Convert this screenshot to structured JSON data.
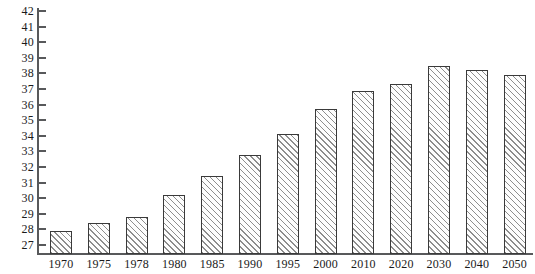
{
  "chart_data": {
    "type": "bar",
    "title": "",
    "subtitle": "",
    "xlabel": "",
    "ylabel": "",
    "categories": [
      "1970",
      "1975",
      "1978",
      "1980",
      "1985",
      "1990",
      "1995",
      "2000",
      "2010",
      "2020",
      "2030",
      "2040",
      "2050"
    ],
    "values": [
      27.9,
      28.4,
      28.8,
      30.2,
      31.4,
      32.8,
      34.1,
      35.7,
      36.9,
      37.3,
      38.5,
      38.2,
      37.9
    ],
    "series": [
      {
        "name": "",
        "values": [
          27.9,
          28.4,
          28.8,
          30.2,
          31.4,
          32.8,
          34.1,
          35.7,
          36.9,
          37.3,
          38.5,
          38.2,
          37.9
        ]
      }
    ],
    "ylim": [
      27,
      42
    ],
    "xlim": null,
    "ytick_labels": [
      "42",
      "41",
      "40",
      "39",
      "38",
      "37",
      "36",
      "35",
      "34",
      "33",
      "32",
      "31",
      "30",
      "29",
      "28",
      "27"
    ],
    "ytick_values": [
      42,
      41,
      40,
      39,
      38,
      37,
      36,
      35,
      34,
      33,
      32,
      31,
      30,
      29,
      28,
      27
    ],
    "xtick_labels": [
      "1970",
      "1975",
      "1978",
      "1980",
      "1985",
      "1990",
      "1995",
      "2000",
      "2010",
      "2020",
      "2030",
      "2040",
      "2050"
    ],
    "grid": false,
    "legend": null,
    "legend_position": "none",
    "annotations": [],
    "bar_fill": "diagonal-hatch",
    "bar_edge_color": "#3a3a3a",
    "bar_hatch_color": "#8d8d8d",
    "axis_color": "#58595b",
    "text_color": "#1a1a1a",
    "background_color": "#ffffff"
  }
}
